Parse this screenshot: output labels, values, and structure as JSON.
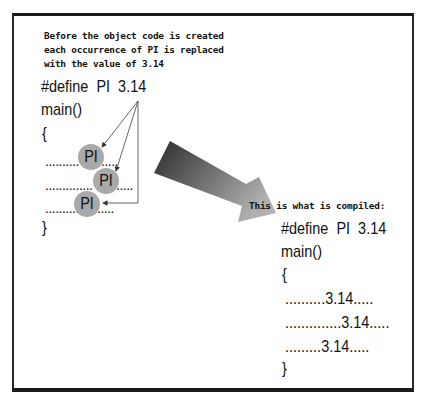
{
  "caption_top": [
    "Before the object code is created",
    "each occurrence of PI is replaced",
    "with the value of 3.14"
  ],
  "caption_right": "This is what is compiled:",
  "left_code": {
    "define": "#define  PI  3.14",
    "main": "main()",
    "open_brace": "{",
    "close_brace": "}",
    "lines": [
      {
        "prefix": "..........",
        "token": "PI",
        "suffix": "....."
      },
      {
        "prefix": "..............",
        "token": "PI",
        "suffix": "....."
      },
      {
        "prefix": "..........",
        "token": "PI",
        "suffix": "....."
      }
    ]
  },
  "right_code": {
    "define": "#define  PI  3.14",
    "main": "main()",
    "open_brace": "{",
    "close_brace": "}",
    "lines": [
      "..........3.14.....",
      "..............3.14.....",
      ".........3.14....."
    ]
  },
  "colors": {
    "circle": "#a9a9a9",
    "arrow_dark": "#2b2b2b",
    "arrow_light": "#b0b0b0",
    "line": "#555555"
  }
}
